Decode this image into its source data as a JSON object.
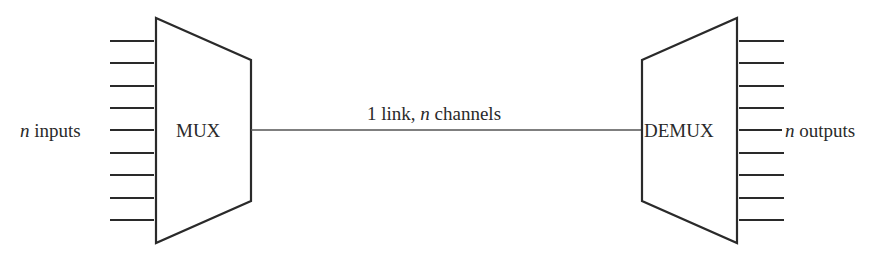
{
  "diagram": {
    "type": "multiplexing",
    "stroke_color": "#2a2a2a",
    "link_color": "#555555",
    "input_label_var": "n",
    "input_label_text": " inputs",
    "output_label_var": "n",
    "output_label_text": " outputs",
    "mux_label": "MUX",
    "demux_label": "DEMUX",
    "link_label_prefix": "1 link, ",
    "link_label_var": "n",
    "link_label_suffix": " channels",
    "line_count": 9
  }
}
